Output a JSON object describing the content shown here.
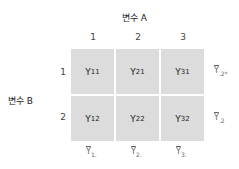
{
  "factor_a": {
    "label": "변수 A",
    "levels": [
      "1",
      "2",
      "3"
    ]
  },
  "factor_b": {
    "label": "변수 B",
    "levels": [
      "1",
      "2"
    ]
  },
  "cells": [
    [
      {
        "base": "Y",
        "sub": "11"
      },
      {
        "base": "Y",
        "sub": "21"
      },
      {
        "base": "Y",
        "sub": "31"
      }
    ],
    [
      {
        "base": "Y",
        "sub": "12"
      },
      {
        "base": "Y",
        "sub": "22"
      },
      {
        "base": "Y",
        "sub": "32"
      }
    ]
  ],
  "row_means": [
    {
      "base": "Y",
      "sub": ".2*"
    },
    {
      "base": "Y",
      "sub": ".2"
    }
  ],
  "col_means": [
    {
      "base": "Y",
      "sub": "1."
    },
    {
      "base": "Y",
      "sub": "2."
    },
    {
      "base": "Y",
      "sub": "3."
    }
  ],
  "colors": {
    "cell_fill": "#dcdcdc",
    "text": "#222222",
    "mean_text": "#666666"
  }
}
